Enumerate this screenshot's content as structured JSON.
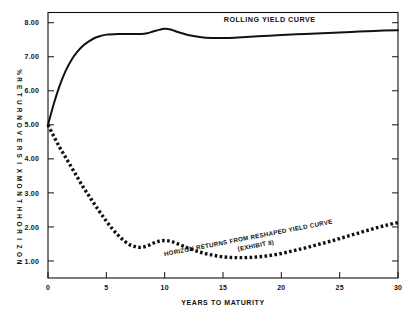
{
  "chart_data": {
    "type": "line",
    "title": "",
    "xlabel": "YEARS TO MATURITY",
    "ylabel": "% RETURN OVER SIX MONTH HORIZON",
    "ylabel_chars": [
      "%",
      "R",
      "E",
      "T",
      "U",
      "R",
      "N",
      "O",
      "V",
      "E",
      "R",
      "S",
      "I",
      "X",
      "M",
      "O",
      "N",
      "T",
      "H",
      "H",
      "O",
      "R",
      "I",
      "Z",
      "O",
      "N"
    ],
    "xlim": [
      0,
      30
    ],
    "ylim": [
      0.5,
      8.3
    ],
    "grid": false,
    "legend": "inline-annotations",
    "xticks": [
      0,
      5,
      10,
      15,
      20,
      25,
      30
    ],
    "xtick_labels": [
      "0",
      "5",
      "10",
      "15",
      "20",
      "25",
      "30"
    ],
    "yticks": [
      1.0,
      2.0,
      3.0,
      4.0,
      5.0,
      6.0,
      7.0,
      8.0
    ],
    "ytick_labels": [
      "1.00",
      "2.00",
      "3.00",
      "4.00",
      "5.00",
      "6.00",
      "7.00",
      "8.00"
    ],
    "series": [
      {
        "name": "ROLLING YIELD CURVE",
        "style": "solid",
        "label_x": 19.0,
        "label_y": 8.02,
        "x": [
          0,
          0.5,
          1,
          1.5,
          2,
          2.5,
          3,
          3.5,
          4,
          4.5,
          5,
          6,
          7,
          8,
          8.5,
          9,
          9.5,
          10,
          10.5,
          11,
          12,
          13,
          14,
          15,
          16,
          17,
          18,
          19,
          20,
          22,
          24,
          26,
          28,
          30
        ],
        "values": [
          5.0,
          5.62,
          6.15,
          6.58,
          6.9,
          7.14,
          7.32,
          7.45,
          7.55,
          7.61,
          7.65,
          7.67,
          7.67,
          7.67,
          7.69,
          7.74,
          7.79,
          7.82,
          7.8,
          7.74,
          7.64,
          7.58,
          7.55,
          7.55,
          7.56,
          7.58,
          7.6,
          7.62,
          7.64,
          7.67,
          7.7,
          7.73,
          7.76,
          7.78
        ]
      },
      {
        "name": "HORIZON RETURNS FROM RESHAPED YIELD CURVE",
        "sublabel": "(EXHIBIT 8)",
        "style": "dotted",
        "label_x": 17.2,
        "label_y": 1.62,
        "x": [
          0,
          0.5,
          1,
          1.5,
          2,
          2.5,
          3,
          3.5,
          4,
          4.5,
          5,
          5.5,
          6,
          6.5,
          7,
          7.5,
          8,
          8.5,
          9,
          9.5,
          10,
          10.5,
          11,
          11.5,
          12,
          13,
          14,
          15,
          16,
          17,
          18,
          19,
          20,
          21,
          22,
          23,
          24,
          25,
          26,
          27,
          28,
          29,
          30
        ],
        "values": [
          5.0,
          4.66,
          4.34,
          4.05,
          3.76,
          3.47,
          3.18,
          2.92,
          2.66,
          2.41,
          2.17,
          1.95,
          1.76,
          1.6,
          1.48,
          1.42,
          1.4,
          1.44,
          1.52,
          1.58,
          1.6,
          1.58,
          1.52,
          1.45,
          1.38,
          1.26,
          1.18,
          1.12,
          1.1,
          1.1,
          1.12,
          1.16,
          1.22,
          1.3,
          1.38,
          1.47,
          1.56,
          1.66,
          1.76,
          1.86,
          1.96,
          2.05,
          2.13
        ]
      }
    ]
  },
  "colors": {
    "ink": "#111111",
    "background": "#ffffff"
  }
}
